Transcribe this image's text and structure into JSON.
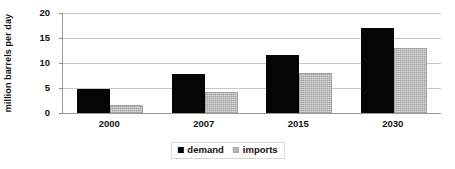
{
  "chart_data": {
    "type": "bar",
    "title": "",
    "xlabel": "",
    "ylabel": "million barrels per day",
    "categories": [
      "2000",
      "2007",
      "2015",
      "2030"
    ],
    "series": [
      {
        "name": "demand",
        "color": "#050505",
        "values": [
          4.8,
          7.8,
          11.7,
          17.0
        ]
      },
      {
        "name": "imports",
        "color": "#b4b4b4",
        "values": [
          1.6,
          4.2,
          8.1,
          13.0
        ]
      }
    ],
    "ylim": [
      0,
      20
    ],
    "ytick_labels": [
      "0",
      "5",
      "10",
      "15",
      "20"
    ],
    "ytick_values": [
      0,
      5,
      10,
      15,
      20
    ],
    "grid": true,
    "legend_position": "bottom"
  },
  "legend": {
    "items": [
      {
        "label": "demand",
        "swatch": "black-square-swatch"
      },
      {
        "label": "imports",
        "swatch": "gray-square-swatch"
      }
    ]
  }
}
